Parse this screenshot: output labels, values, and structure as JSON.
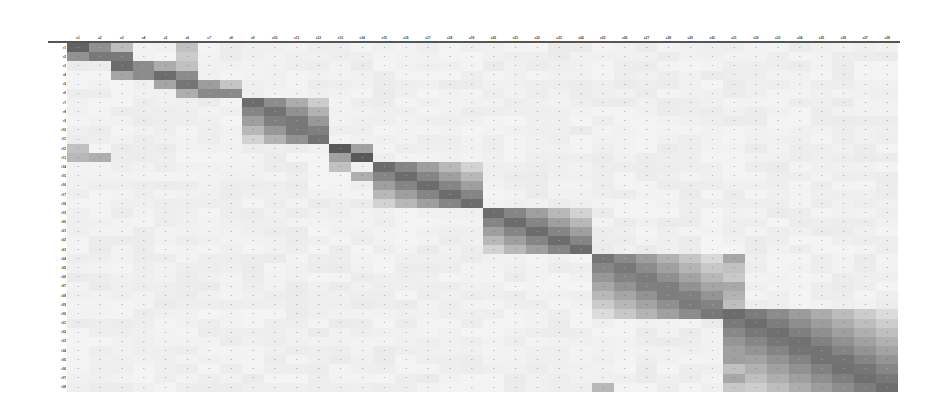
{
  "chart_data": {
    "type": "heatmap",
    "title": "",
    "xlabel": "",
    "ylabel": "",
    "legend": "none",
    "grid": false,
    "colormap": "grayscale (white = low, dark gray = high)",
    "note": "Confusion-matrix style heatmap; class label text is too small/blurred to be legible in the source image",
    "n_rows": 38,
    "n_cols": 38,
    "x_labels": [
      "c1",
      "c2",
      "c3",
      "c4",
      "c5",
      "c6",
      "c7",
      "c8",
      "c9",
      "c10",
      "c11",
      "c12",
      "c13",
      "c14",
      "c15",
      "c16",
      "c17",
      "c18",
      "c19",
      "c20",
      "c21",
      "c22",
      "c23",
      "c24",
      "c25",
      "c26",
      "c27",
      "c28",
      "c29",
      "c30",
      "c31",
      "c32",
      "c33",
      "c34",
      "c35",
      "c36",
      "c37",
      "c38"
    ],
    "y_labels": [
      "r1",
      "r2",
      "r3",
      "r4",
      "r5",
      "r6",
      "r7",
      "r8",
      "r9",
      "r10",
      "r11",
      "r12",
      "r13",
      "r14",
      "r15",
      "r16",
      "r17",
      "r18",
      "r19",
      "r20",
      "r21",
      "r22",
      "r23",
      "r24",
      "r25",
      "r26",
      "r27",
      "r28",
      "r29",
      "r30",
      "r31",
      "r32",
      "r33",
      "r34",
      "r35",
      "r36",
      "r37",
      "r38"
    ],
    "diagonal_blocks": [
      {
        "rows": [
          0,
          1
        ],
        "cols": [
          0,
          2
        ],
        "intensity": 0.8
      },
      {
        "rows": [
          2,
          3
        ],
        "cols": [
          2,
          5
        ],
        "intensity": 0.75
      },
      {
        "rows": [
          4,
          5
        ],
        "cols": [
          5,
          7
        ],
        "intensity": 0.7
      },
      {
        "rows": [
          6,
          10
        ],
        "cols": [
          8,
          11
        ],
        "intensity": 0.75
      },
      {
        "rows": [
          11,
          12
        ],
        "cols": [
          12,
          13
        ],
        "intensity": 0.85
      },
      {
        "rows": [
          13,
          17
        ],
        "cols": [
          14,
          18
        ],
        "intensity": 0.75
      },
      {
        "rows": [
          18,
          22
        ],
        "cols": [
          19,
          23
        ],
        "intensity": 0.75
      },
      {
        "rows": [
          23,
          29
        ],
        "cols": [
          24,
          29
        ],
        "intensity": 0.7
      },
      {
        "rows": [
          29,
          37
        ],
        "cols": [
          30,
          37
        ],
        "intensity": 0.75
      }
    ],
    "highlight_column": {
      "col": 30,
      "rows": [
        23,
        37
      ],
      "intensity": 0.45
    },
    "cell_values_shown": "small numeric annotations in every cell (illegible)"
  }
}
